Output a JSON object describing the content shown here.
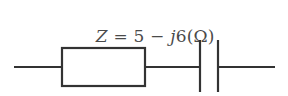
{
  "figure": {
    "type": "electrical-circuit-diagram",
    "background_color": "#ffffff",
    "stroke_color": "#333333",
    "text_color": "#4a4a4a",
    "width": 288,
    "height": 96
  },
  "formula": {
    "full_text": "Z = 5 − j6(Ω)",
    "impedance_symbol": "Z",
    "equals": "=",
    "real_part": "5",
    "sign": "−",
    "imaginary_unit": "j",
    "imaginary_part": "6",
    "open_paren": "(",
    "unit": "Ω",
    "close_paren": ")"
  },
  "circuit": {
    "description": "Series RC circuit: resistor in series with capacitor",
    "elements": [
      {
        "name": "left-terminal-wire",
        "type": "wire",
        "x1": 14,
        "y1": 37,
        "x2": 62,
        "y2": 37
      },
      {
        "name": "resistor",
        "type": "resistor-rectangle",
        "x": 62,
        "y": 18,
        "width": 83,
        "height": 38
      },
      {
        "name": "middle-wire",
        "type": "wire",
        "x1": 145,
        "y1": 37,
        "x2": 200,
        "y2": 37
      },
      {
        "name": "capacitor-plate-left",
        "type": "capacitor-plate",
        "x": 200,
        "y1": 10,
        "y2": 62
      },
      {
        "name": "capacitor-plate-right",
        "type": "capacitor-plate",
        "x": 218,
        "y1": 10,
        "y2": 62
      },
      {
        "name": "right-terminal-wire",
        "type": "wire",
        "x1": 218,
        "y1": 37,
        "x2": 275,
        "y2": 37
      }
    ]
  }
}
